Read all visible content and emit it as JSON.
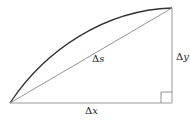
{
  "diagram": {
    "colors": {
      "background": "#ffffff",
      "curve": "#333333",
      "lines": "#888888",
      "text": "#222222"
    },
    "points": {
      "start": [
        10,
        103
      ],
      "end": [
        172,
        8
      ],
      "corner": [
        172,
        103
      ]
    },
    "labels": {
      "hypotenuse": {
        "delta": "Δ",
        "var": "s"
      },
      "base": {
        "delta": "Δ",
        "var": "x"
      },
      "height": {
        "delta": "Δ",
        "var": "y"
      }
    },
    "right_angle_marker_size": 11
  }
}
